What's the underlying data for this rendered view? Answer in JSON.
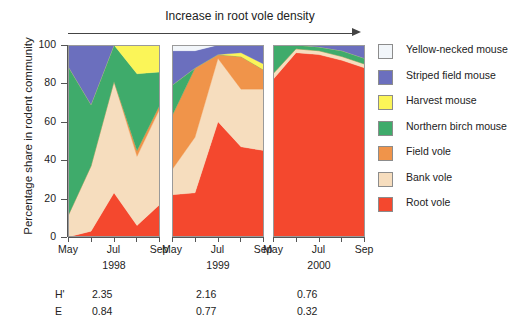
{
  "title": {
    "text": "Increase in root vole density"
  },
  "axes": {
    "ylabel": "Percentage share in rodent community",
    "yticks": [
      "100",
      "80",
      "60",
      "40",
      "20",
      "0"
    ],
    "xticklabels": [
      "May",
      "Jul",
      "Sep"
    ]
  },
  "panels": [
    {
      "year": "1998",
      "H": "2.35",
      "E": "0.84"
    },
    {
      "year": "1999",
      "H": "2.16",
      "E": "0.77"
    },
    {
      "year": "2000",
      "H": "0.76",
      "E": "0.32"
    }
  ],
  "stats": {
    "h_key": "H'",
    "e_key": "E"
  },
  "legend": [
    {
      "label": "Yellow-necked mouse",
      "color": "#f2f6fa"
    },
    {
      "label": "Striped field mouse",
      "color": "#6b6fbe"
    },
    {
      "label": "Harvest mouse",
      "color": "#fbf558"
    },
    {
      "label": "Northern birch mouse",
      "color": "#3fab6b"
    },
    {
      "label": "Field vole",
      "color": "#f0944a"
    },
    {
      "label": "Bank vole",
      "color": "#f6ddbe"
    },
    {
      "label": "Root vole",
      "color": "#f4482e"
    }
  ],
  "chart_data": {
    "type": "area",
    "title": "Increase in root vole density",
    "xlabel": "",
    "ylabel": "Percentage share in rodent community",
    "ylim": [
      0,
      100
    ],
    "grid": false,
    "legend_position": "right",
    "stacking": "percent",
    "x": [
      "May",
      "Jun",
      "Jul",
      "Aug",
      "Sep"
    ],
    "panel_years": [
      "1998",
      "1999",
      "2000"
    ],
    "diversity_indices": {
      "H'": [
        2.35,
        2.16,
        0.76
      ],
      "E": [
        0.84,
        0.77,
        0.32
      ]
    },
    "series_order_bottom_to_top": [
      "Root vole",
      "Bank vole",
      "Field vole",
      "Northern birch mouse",
      "Harvest mouse",
      "Striped field mouse",
      "Yellow-necked mouse"
    ],
    "panels": [
      {
        "year": "1998",
        "series": [
          {
            "name": "Root vole",
            "color": "#f4482e",
            "values": [
              0,
              3,
              23,
              6,
              17
            ]
          },
          {
            "name": "Bank vole",
            "color": "#f6ddbe",
            "values": [
              11,
              34,
              58,
              36,
              50
            ]
          },
          {
            "name": "Field vole",
            "color": "#f0944a",
            "values": [
              0,
              0,
              0,
              3,
              2
            ]
          },
          {
            "name": "Northern birch mouse",
            "color": "#3fab6b",
            "values": [
              78,
              32,
              19,
              40,
              17
            ]
          },
          {
            "name": "Harvest mouse",
            "color": "#fbf558",
            "values": [
              0,
              0,
              0,
              15,
              14
            ]
          },
          {
            "name": "Striped field mouse",
            "color": "#6b6fbe",
            "values": [
              11,
              31,
              0,
              0,
              0
            ]
          },
          {
            "name": "Yellow-necked mouse",
            "color": "#f2f6fa",
            "values": [
              0,
              0,
              0,
              0,
              0
            ]
          }
        ]
      },
      {
        "year": "1999",
        "series": [
          {
            "name": "Root vole",
            "color": "#f4482e",
            "values": [
              22,
              23,
              60,
              47,
              45
            ]
          },
          {
            "name": "Bank vole",
            "color": "#f6ddbe",
            "values": [
              13,
              29,
              33,
              30,
              32
            ]
          },
          {
            "name": "Field vole",
            "color": "#f0944a",
            "values": [
              28,
              36,
              2,
              17,
              10
            ]
          },
          {
            "name": "Northern birch mouse",
            "color": "#3fab6b",
            "values": [
              16,
              0,
              0,
              0,
              0
            ]
          },
          {
            "name": "Harvest mouse",
            "color": "#fbf558",
            "values": [
              0,
              0,
              0,
              2,
              3
            ]
          },
          {
            "name": "Striped field mouse",
            "color": "#6b6fbe",
            "values": [
              18,
              9,
              5,
              4,
              10
            ]
          },
          {
            "name": "Yellow-necked mouse",
            "color": "#f2f6fa",
            "values": [
              3,
              3,
              0,
              0,
              0
            ]
          }
        ]
      },
      {
        "year": "2000",
        "series": [
          {
            "name": "Root vole",
            "color": "#f4482e",
            "values": [
              82,
              96,
              95,
              92,
              88
            ]
          },
          {
            "name": "Bank vole",
            "color": "#f6ddbe",
            "values": [
              3,
              2,
              2,
              2,
              2
            ]
          },
          {
            "name": "Field vole",
            "color": "#f0944a",
            "values": [
              0,
              0,
              0,
              0,
              0
            ]
          },
          {
            "name": "Northern birch mouse",
            "color": "#3fab6b",
            "values": [
              15,
              2,
              2,
              3,
              3
            ]
          },
          {
            "name": "Harvest mouse",
            "color": "#fbf558",
            "values": [
              0,
              0,
              0,
              0,
              0
            ]
          },
          {
            "name": "Striped field mouse",
            "color": "#6b6fbe",
            "values": [
              0,
              0,
              1,
              3,
              7
            ]
          },
          {
            "name": "Yellow-necked mouse",
            "color": "#f2f6fa",
            "values": [
              0,
              0,
              0,
              0,
              0
            ]
          }
        ]
      }
    ]
  }
}
